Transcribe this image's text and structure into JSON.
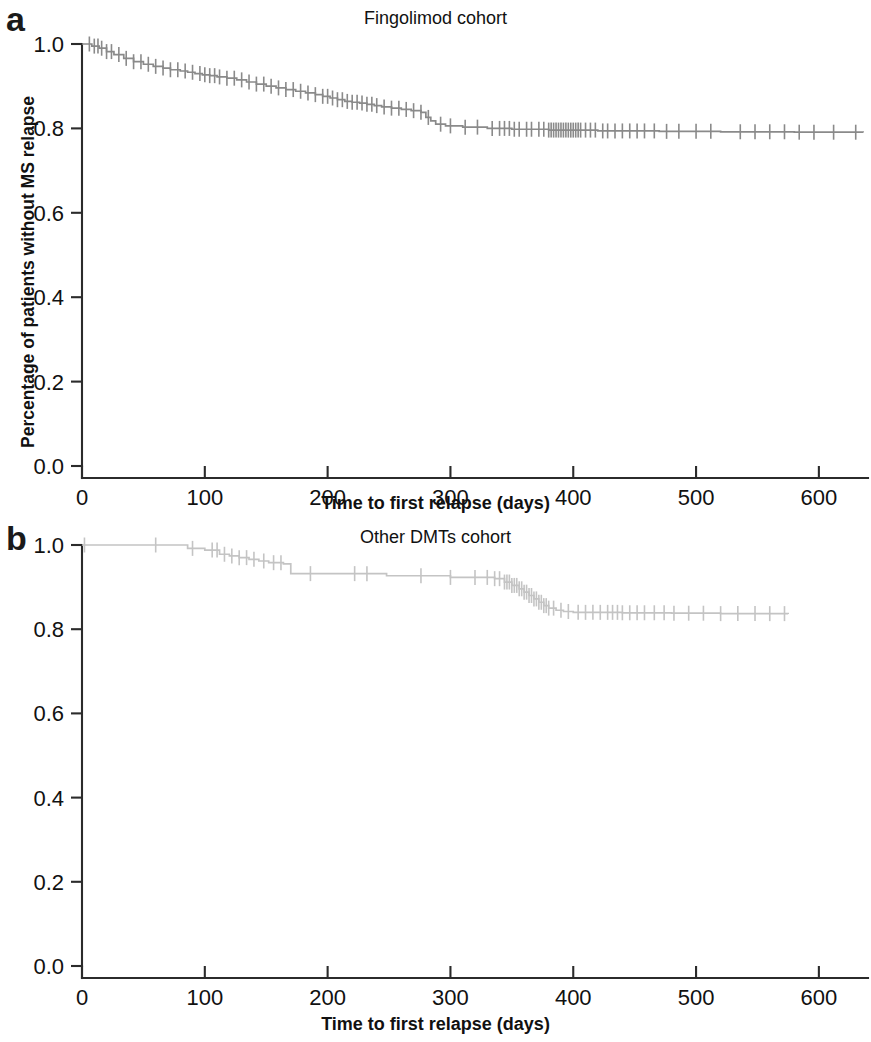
{
  "figure": {
    "panels": [
      {
        "letter": "a",
        "title": "Fingolimod cohort",
        "xlabel": "Time to first relapse (days)",
        "ylabel": "Percentage of patients without MS relapse"
      },
      {
        "letter": "b",
        "title": "Other DMTs cohort",
        "xlabel": "Time to first relapse (days)",
        "ylabel": "Percentage of patients without MS relapse"
      }
    ]
  },
  "chart_data": [
    {
      "type": "line",
      "plot_kind": "kaplan-meier-survival",
      "title": "Fingolimod cohort",
      "panel": "a",
      "xlabel": "Time to first relapse (days)",
      "ylabel": "Percentage of patients without MS relapse",
      "xlim": [
        0,
        640
      ],
      "ylim": [
        0.0,
        1.0
      ],
      "xticks": [
        0,
        100,
        200,
        300,
        400,
        500,
        600
      ],
      "xtick_labels": [
        "0",
        "100",
        "200",
        "300",
        "400",
        "500",
        "600"
      ],
      "yticks": [
        0.0,
        0.2,
        0.4,
        0.6,
        0.8,
        1.0
      ],
      "ytick_labels": [
        "0.0",
        "0.2",
        "0.4",
        "0.6",
        "0.8",
        "1.0"
      ],
      "grid": false,
      "legend": null,
      "line_color": "#8a8a8a",
      "series": [
        {
          "name": "Fingolimod cohort survival",
          "step": "post",
          "x": [
            0,
            8,
            14,
            20,
            26,
            34,
            42,
            50,
            58,
            66,
            72,
            80,
            86,
            92,
            98,
            104,
            110,
            118,
            126,
            134,
            142,
            150,
            158,
            166,
            174,
            182,
            190,
            196,
            202,
            208,
            214,
            220,
            226,
            232,
            238,
            244,
            252,
            260,
            268,
            276,
            280,
            284,
            288,
            296,
            310,
            330,
            350,
            380,
            420,
            470,
            520,
            580,
            636
          ],
          "y": [
            1.0,
            0.995,
            0.99,
            0.982,
            0.975,
            0.966,
            0.958,
            0.952,
            0.947,
            0.943,
            0.939,
            0.936,
            0.933,
            0.93,
            0.927,
            0.925,
            0.922,
            0.919,
            0.915,
            0.91,
            0.905,
            0.9,
            0.896,
            0.892,
            0.888,
            0.884,
            0.88,
            0.876,
            0.872,
            0.868,
            0.864,
            0.862,
            0.86,
            0.857,
            0.854,
            0.851,
            0.848,
            0.845,
            0.842,
            0.838,
            0.826,
            0.818,
            0.81,
            0.806,
            0.803,
            0.8,
            0.798,
            0.796,
            0.794,
            0.793,
            0.792,
            0.791,
            0.79
          ]
        }
      ],
      "censor_marks_x": [
        6,
        10,
        13,
        16,
        20,
        24,
        30,
        36,
        42,
        48,
        54,
        60,
        66,
        72,
        78,
        84,
        90,
        96,
        100,
        104,
        108,
        112,
        118,
        124,
        130,
        136,
        142,
        148,
        154,
        160,
        166,
        172,
        178,
        184,
        190,
        196,
        200,
        204,
        208,
        212,
        216,
        220,
        224,
        228,
        232,
        236,
        240,
        246,
        252,
        258,
        264,
        270,
        276,
        282,
        292,
        300,
        312,
        322,
        334,
        340,
        344,
        348,
        352,
        356,
        362,
        366,
        372,
        376,
        380,
        382,
        384,
        386,
        388,
        390,
        392,
        394,
        396,
        398,
        400,
        402,
        404,
        406,
        410,
        414,
        418,
        424,
        428,
        434,
        440,
        446,
        452,
        458,
        466,
        476,
        486,
        500,
        512,
        536,
        548,
        560,
        572,
        584,
        596,
        612,
        630
      ],
      "last_x": 636,
      "last_y": 0.79
    },
    {
      "type": "line",
      "plot_kind": "kaplan-meier-survival",
      "title": "Other DMTs cohort",
      "panel": "b",
      "xlabel": "Time to first relapse (days)",
      "ylabel": "Percentage of patients without MS relapse",
      "xlim": [
        0,
        640
      ],
      "ylim": [
        0.0,
        1.0
      ],
      "xticks": [
        0,
        100,
        200,
        300,
        400,
        500,
        600
      ],
      "xtick_labels": [
        "0",
        "100",
        "200",
        "300",
        "400",
        "500",
        "600"
      ],
      "yticks": [
        0.0,
        0.2,
        0.4,
        0.6,
        0.8,
        1.0
      ],
      "ytick_labels": [
        "0.0",
        "0.2",
        "0.4",
        "0.6",
        "0.8",
        "1.0"
      ],
      "grid": false,
      "legend": null,
      "line_color": "#c4c4c4",
      "series": [
        {
          "name": "Other DMTs cohort survival",
          "step": "post",
          "x": [
            0,
            78,
            86,
            100,
            112,
            120,
            128,
            136,
            144,
            152,
            164,
            170,
            240,
            248,
            300,
            336,
            344,
            350,
            356,
            360,
            364,
            368,
            372,
            376,
            380,
            386,
            392,
            400,
            440,
            480,
            520,
            575
          ],
          "y": [
            1.0,
            1.0,
            0.992,
            0.988,
            0.978,
            0.974,
            0.97,
            0.966,
            0.962,
            0.958,
            0.955,
            0.932,
            0.932,
            0.927,
            0.923,
            0.92,
            0.912,
            0.904,
            0.896,
            0.888,
            0.88,
            0.872,
            0.864,
            0.856,
            0.85,
            0.845,
            0.842,
            0.84,
            0.839,
            0.838,
            0.837,
            0.836
          ]
        }
      ],
      "censor_marks_x": [
        2,
        60,
        90,
        106,
        110,
        116,
        122,
        128,
        134,
        140,
        148,
        156,
        162,
        186,
        222,
        232,
        276,
        300,
        320,
        330,
        336,
        340,
        344,
        346,
        348,
        350,
        352,
        354,
        356,
        358,
        360,
        362,
        364,
        366,
        368,
        370,
        372,
        374,
        376,
        378,
        380,
        384,
        390,
        396,
        404,
        410,
        416,
        422,
        428,
        432,
        436,
        440,
        446,
        452,
        458,
        466,
        474,
        482,
        494,
        506,
        520,
        534,
        548,
        560,
        572
      ],
      "last_x": 575,
      "last_y": 0.836
    }
  ]
}
